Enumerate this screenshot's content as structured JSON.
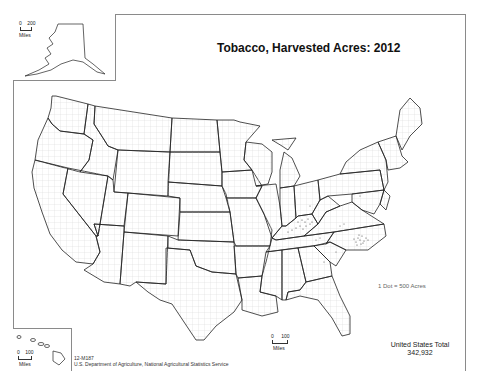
{
  "map": {
    "title": "Tobacco, Harvested Acres:  2012",
    "legend": {
      "dot_label": "1 Dot = 500 Acres",
      "dot_value_acres": 500
    },
    "total": {
      "label": "United States Total",
      "value": "342,932"
    },
    "credit": {
      "code": "12-M187",
      "agency": "U.S. Department of Agriculture, National Agricultural Statistics Service"
    },
    "insets": {
      "alaska": {
        "scale_min": "0",
        "scale_max": "200",
        "scale_unit": "Miles"
      },
      "hawaii": {
        "scale_min": "0",
        "scale_max": "100",
        "scale_unit": "Miles"
      }
    },
    "main_scale": {
      "scale_min": "0",
      "scale_max": "100",
      "scale_unit": "Miles"
    },
    "dot_concentrations": [
      {
        "region": "Kentucky",
        "density": "high"
      },
      {
        "region": "North Carolina",
        "density": "high"
      },
      {
        "region": "Virginia",
        "density": "medium"
      },
      {
        "region": "Tennessee",
        "density": "medium"
      },
      {
        "region": "South Carolina",
        "density": "low"
      },
      {
        "region": "Georgia",
        "density": "low"
      },
      {
        "region": "Pennsylvania",
        "density": "low"
      },
      {
        "region": "Ohio",
        "density": "low"
      }
    ],
    "colors": {
      "state_border": "#222222",
      "county_border": "#c8c8c8",
      "dot": "#555555",
      "frame": "#8a8a8a"
    }
  }
}
